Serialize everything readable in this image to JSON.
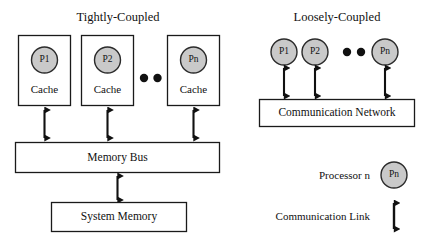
{
  "figure": {
    "title_left": "Tightly-Coupled",
    "title_right": "Loosely-Coupled"
  },
  "colors": {
    "processor_fill": "#c9c9c9",
    "processor_stroke": "#2b2b2b",
    "box_stroke": "#1a1a1a",
    "arrow": "#111111",
    "dot": "#111111",
    "background": "#ffffff",
    "text": "#111111"
  },
  "tightly_coupled": {
    "title": "Tightly-Coupled",
    "nodes": [
      {
        "processor": "P1",
        "cache": "Cache"
      },
      {
        "processor": "P2",
        "cache": "Cache"
      },
      {
        "processor": "Pn",
        "cache": "Cache"
      }
    ],
    "ellipsis": "● ●",
    "bus": "Memory Bus",
    "memory": "System Memory"
  },
  "loosely_coupled": {
    "title": "Loosely-Coupled",
    "nodes": [
      {
        "processor": "P1"
      },
      {
        "processor": "P2"
      },
      {
        "processor": "Pn"
      }
    ],
    "ellipsis": "● ●",
    "network": "Communication Network"
  },
  "legend": {
    "items": [
      {
        "label": "Processor n",
        "symbol": "Pn",
        "symbol_type": "circle"
      },
      {
        "label": "Communication Link",
        "symbol": "",
        "symbol_type": "double-arrow"
      }
    ]
  }
}
